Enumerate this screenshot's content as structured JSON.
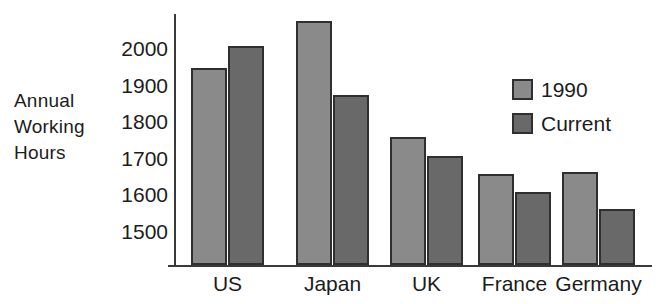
{
  "chart_data": {
    "type": "bar",
    "title": "",
    "xlabel": "",
    "ylabel": "Annual Working Hours",
    "ylabel_lines": [
      "Annual",
      "Working",
      "Hours"
    ],
    "categories": [
      "US",
      "Japan",
      "UK",
      "France",
      "Germany"
    ],
    "series": [
      {
        "name": "1990",
        "color": "#8a8a8a",
        "values": [
          1945,
          2075,
          1755,
          1655,
          1660
        ]
      },
      {
        "name": "Current",
        "color": "#696969",
        "values": [
          2005,
          1870,
          1705,
          1605,
          1560
        ]
      }
    ],
    "yticks": [
      1500,
      1600,
      1700,
      1800,
      1900,
      2000
    ],
    "ytick_labels": [
      "1500",
      "1600",
      "1700",
      "1800",
      "1900",
      "2000"
    ],
    "ylim": [
      1135,
      2155
    ],
    "grid": false,
    "legend": {
      "position": "upper-right",
      "entries": [
        {
          "label": "1990",
          "color": "#8a8a8a"
        },
        {
          "label": "Current",
          "color": "#696969"
        }
      ]
    },
    "axis_color": "#3a3a3a",
    "bar_outline_color": "#2f2f2f",
    "background": "#ffffff"
  }
}
